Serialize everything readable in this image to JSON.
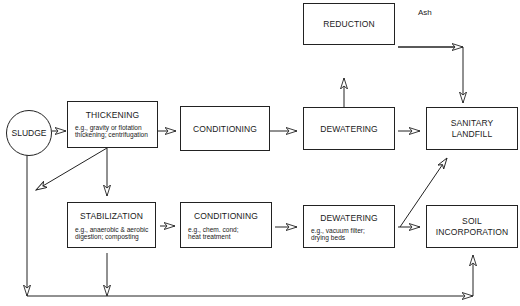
{
  "diagram": {
    "type": "flowchart",
    "nodes": {
      "sludge": {
        "label": "SLUDGE"
      },
      "thickening": {
        "label": "THICKENING",
        "example": "e.g., gravity or flotation thickening; centrifugation",
        "example_line1": "e.g., gravity or flotation",
        "example_line2": "thickening; centrifugation"
      },
      "conditioning_top": {
        "label": "CONDITIONING"
      },
      "dewatering_top": {
        "label": "DEWATERING"
      },
      "reduction": {
        "label": "REDUCTION"
      },
      "sanitary_landfill": {
        "label": "SANITARY LANDFILL",
        "line1": "SANITARY",
        "line2": "LANDFILL"
      },
      "stabilization": {
        "label": "STABILIZATION",
        "example_line1": "e.g., anaerobic  & aerobic",
        "example_line2": "digestion;  composting"
      },
      "conditioning_bottom": {
        "label": "CONDITIONING",
        "example_line1": "e.g., chem. cond;",
        "example_line2": "heat treatment"
      },
      "dewatering_bottom": {
        "label": "DEWATERING",
        "example_line1": "e.g., vacuum filter;",
        "example_line2": "drying beds"
      },
      "soil_incorporation": {
        "label": "SOIL INCORPORATION",
        "line1": "SOIL",
        "line2": "INCORPORATION"
      }
    },
    "edge_labels": {
      "ash": "Ash"
    },
    "edges": [
      [
        "sludge",
        "thickening"
      ],
      [
        "thickening",
        "conditioning_top"
      ],
      [
        "conditioning_top",
        "dewatering_top"
      ],
      [
        "dewatering_top",
        "sanitary_landfill"
      ],
      [
        "dewatering_top",
        "reduction"
      ],
      [
        "reduction",
        "sanitary_landfill",
        "Ash"
      ],
      [
        "thickening",
        "stabilization"
      ],
      [
        "thickening",
        "bypass_line"
      ],
      [
        "stabilization",
        "conditioning_bottom"
      ],
      [
        "conditioning_bottom",
        "dewatering_bottom"
      ],
      [
        "dewatering_bottom",
        "soil_incorporation"
      ],
      [
        "dewatering_bottom",
        "sanitary_landfill"
      ],
      [
        "sludge",
        "soil_incorporation"
      ],
      [
        "stabilization",
        "soil_incorporation"
      ]
    ]
  }
}
